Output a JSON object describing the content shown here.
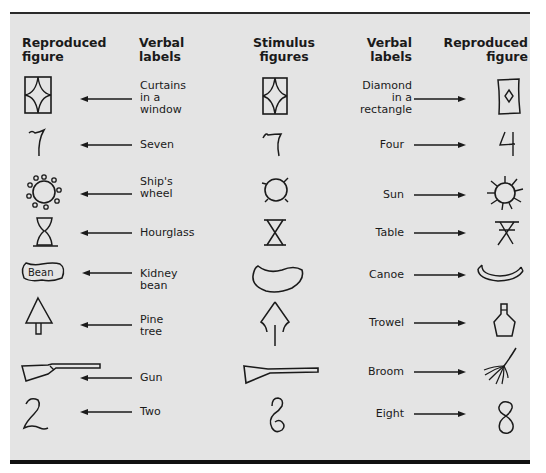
{
  "headers": {
    "left_reproduced": [
      "Reproduced",
      "figure"
    ],
    "left_verbal": [
      "Verbal",
      "labels"
    ],
    "stimulus": [
      "Stimulus",
      "figures"
    ],
    "right_verbal": [
      "Verbal",
      "labels"
    ],
    "right_reproduced": [
      "Reproduced",
      "figure"
    ]
  },
  "rows": [
    {
      "stimulus": "curtains-rectangle-figure",
      "left_label": [
        "Curtains",
        "in a",
        "window"
      ],
      "right_label": [
        "Diamond",
        "in a",
        "rectangle"
      ]
    },
    {
      "stimulus": "seven-like-figure",
      "left_label": [
        "Seven"
      ],
      "right_label": [
        "Four"
      ]
    },
    {
      "stimulus": "circle-with-spokes-figure",
      "left_label": [
        "Ship's",
        "wheel"
      ],
      "right_label": [
        "Sun"
      ]
    },
    {
      "stimulus": "hourglass-table-figure",
      "left_label": [
        "Hourglass"
      ],
      "right_label": [
        "Table"
      ]
    },
    {
      "stimulus": "bean-shape-figure",
      "left_label": [
        "Kidney",
        "bean"
      ],
      "right_label": [
        "Canoe"
      ]
    },
    {
      "stimulus": "tree-trowel-figure",
      "left_label": [
        "Pine",
        "tree"
      ],
      "right_label": [
        "Trowel"
      ]
    },
    {
      "stimulus": "gun-broom-figure",
      "left_label": [
        "Gun"
      ],
      "right_label": [
        "Broom"
      ]
    },
    {
      "stimulus": "two-eight-figure",
      "left_label": [
        "Two"
      ],
      "right_label": [
        "Eight"
      ]
    }
  ],
  "bean_text": "Bean",
  "colors": {
    "panel": "#e4e4e4",
    "ink": "#1a1a1a"
  }
}
